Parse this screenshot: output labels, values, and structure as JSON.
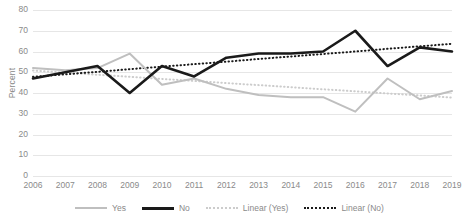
{
  "chart_data": {
    "type": "line",
    "title": "",
    "xlabel": "",
    "ylabel": "Percent",
    "ylim": [
      0,
      80
    ],
    "ytick_step": 10,
    "yticks": [
      "0",
      "10",
      "20",
      "30",
      "40",
      "50",
      "60",
      "70",
      "80"
    ],
    "grid": true,
    "legend_position": "bottom",
    "categories": [
      "2006",
      "2007",
      "2008",
      "2009",
      "2010",
      "2011",
      "2012",
      "2013",
      "2014",
      "2015",
      "2016",
      "2017",
      "2018",
      "2019"
    ],
    "series": [
      {
        "name": "Yes",
        "style": "solid",
        "color": "#bfbfbf",
        "values": [
          52,
          51,
          52,
          59,
          44,
          47,
          42,
          39,
          38,
          38,
          31,
          47,
          37,
          41
        ]
      },
      {
        "name": "No",
        "style": "solid",
        "color": "#1a1a1a",
        "values": [
          47,
          50,
          53,
          40,
          53,
          48,
          57,
          59,
          59,
          60,
          70,
          53,
          62,
          60
        ]
      },
      {
        "name": "Linear (Yes)",
        "style": "dotted",
        "color": "#cccccc",
        "trendline_for": "Yes",
        "values": [
          50.8,
          49.8,
          48.8,
          47.8,
          46.8,
          45.8,
          44.8,
          43.8,
          42.8,
          41.8,
          40.8,
          39.8,
          38.8,
          37.8
        ]
      },
      {
        "name": "Linear (No)",
        "style": "dotted",
        "color": "#1a1a1a",
        "trendline_for": "No",
        "values": [
          47.8,
          49.0,
          50.2,
          51.5,
          52.7,
          53.9,
          55.1,
          56.4,
          57.6,
          58.8,
          60.0,
          61.3,
          62.5,
          63.7
        ]
      }
    ]
  },
  "axis": {
    "y_title": "Percent"
  },
  "colors": {
    "gridline": "#e6e6e6",
    "tick_text": "#8a8a8a",
    "series_yes": "#bfbfbf",
    "series_no": "#1a1a1a",
    "background": "#ffffff"
  }
}
